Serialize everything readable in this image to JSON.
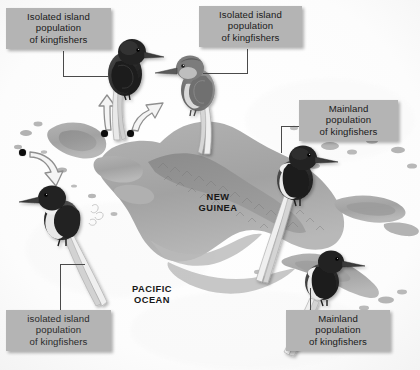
{
  "figure": {
    "background_color": "#fdfdfd",
    "label_box_color": "#b4b4b4",
    "label_text_color": "#1a1a1a",
    "leader_line_color": "#4a4a4a",
    "dot_color": "#0d0d0d",
    "land_color": "#a9a9a9",
    "highland_color": "#8d8d8d",
    "sea_color": "#fbfbfb"
  },
  "callouts": [
    {
      "id": "top-left",
      "lines": [
        "Isolated island",
        "population",
        "of kingfishers"
      ]
    },
    {
      "id": "top-right",
      "lines": [
        "Isolated island",
        "population",
        "of kingfishers"
      ]
    },
    {
      "id": "middle-right",
      "lines": [
        "Mainland",
        "population",
        "of kingfishers"
      ]
    },
    {
      "id": "bottom-left",
      "lines": [
        "isolated island",
        "population",
        "of kingfishers"
      ]
    },
    {
      "id": "bottom-right",
      "lines": [
        "Mainland",
        "population",
        "of kingfishers"
      ]
    }
  ],
  "map_labels": {
    "new_guinea": [
      "NEW",
      "GUINEA"
    ],
    "pacific_ocean": [
      "PACIFIC",
      "OCEAN"
    ]
  },
  "birds": [
    {
      "id": "bird-top-left-dark",
      "plumage": "dark",
      "facing": "right"
    },
    {
      "id": "bird-top-right-light",
      "plumage": "light",
      "facing": "left"
    },
    {
      "id": "bird-left-island",
      "plumage": "mixed",
      "facing": "left"
    },
    {
      "id": "bird-mainland-upper",
      "plumage": "mixed",
      "facing": "right"
    },
    {
      "id": "bird-mainland-lower",
      "plumage": "mixed",
      "facing": "right"
    }
  ],
  "dispersal_arrows": [
    {
      "id": "arrow-west",
      "from_dot": true,
      "direction": "south-west-down"
    },
    {
      "id": "arrow-center-left",
      "from_dot": true,
      "direction": "up-left"
    },
    {
      "id": "arrow-center-right",
      "from_dot": true,
      "direction": "up-right"
    }
  ]
}
